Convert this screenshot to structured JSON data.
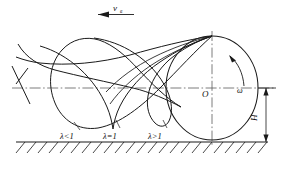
{
  "figure": {
    "type": "technical-diagram",
    "stroke_color": "#1a1a1a",
    "background_color": "#ffffff"
  },
  "labels": {
    "velocity": "v",
    "velocity_subscript": "в",
    "omega": "ω",
    "center": "O",
    "height": "H",
    "curve_curtate": "λ<1",
    "curve_common": "λ=1",
    "curve_prolate": "λ>1"
  },
  "icons": {
    "velocity_arrow": "arrow-left-icon",
    "rotation_arrow": "curved-arrow-ccw-icon",
    "height_arrow": "double-arrow-vertical-icon",
    "ground": "hatched-ground-icon"
  },
  "geometry": {
    "circle_center_x": 212,
    "circle_center_y": 88,
    "circle_rx": 46,
    "circle_ry": 52,
    "ground_y": 142,
    "axis_y": 88,
    "contact_point_x": 212,
    "contact_point_y": 36
  }
}
